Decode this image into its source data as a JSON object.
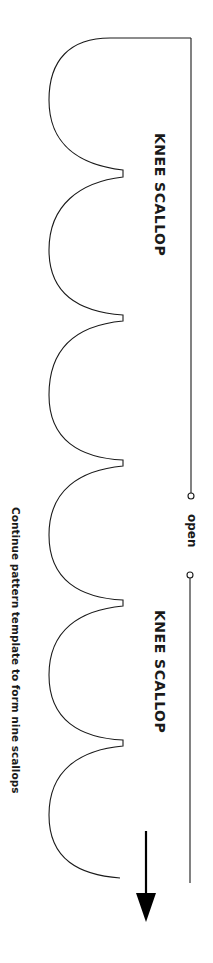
{
  "pattern": {
    "labels": {
      "top_title": "KNEE SCALLOP",
      "bottom_title": "KNEE SCALLOP",
      "opening": "open",
      "instruction": "Continue pattern template to form nine scallops"
    },
    "scallop_count_shown": 5,
    "direction_icon": "arrow-down-icon",
    "colors": {
      "line": "#1a1a1a",
      "background": "#ffffff"
    }
  }
}
